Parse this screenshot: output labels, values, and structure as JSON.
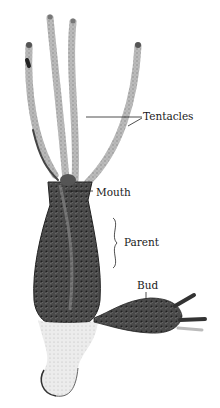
{
  "figure": {
    "labels": {
      "tentacles": "Tentacles",
      "mouth": "Mouth",
      "parent": "Parent",
      "bud": "Bud"
    }
  },
  "colors": {
    "background": "#ffffff",
    "ink": "#1a1a1a",
    "body_dark": "#3a3a3a",
    "body_mid": "#8a8a8a",
    "tentacle": "#b5b5b5",
    "foot_light": "#e2e2e2"
  }
}
